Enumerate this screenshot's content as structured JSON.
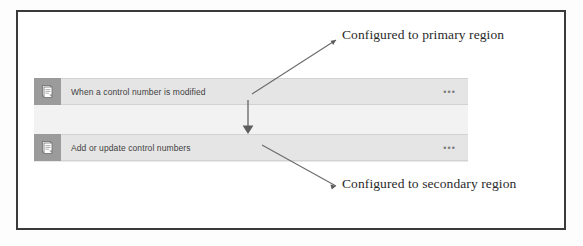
{
  "figure": {
    "type": "flow-designer-screenshot-with-annotations",
    "border_color": "#3a3a3a",
    "card_background": "#e5e5e5",
    "icon_tile_color": "#9b9b9b",
    "annotation_color": "#2a2a2a"
  },
  "flow": {
    "nodes": [
      {
        "id": "trigger",
        "label": "When a control number is modified",
        "icon": "document-page-icon",
        "overflow_label": "•••"
      },
      {
        "id": "action",
        "label": "Add or update control numbers",
        "icon": "document-page-icon",
        "overflow_label": "•••"
      }
    ],
    "connector": {
      "icon": "arrow-down-icon",
      "direction": "down"
    }
  },
  "annotations": [
    {
      "id": "primary-region",
      "text": "Configured to primary region",
      "points_to": "trigger"
    },
    {
      "id": "secondary-region",
      "text": "Configured to secondary region",
      "points_to": "action"
    }
  ]
}
